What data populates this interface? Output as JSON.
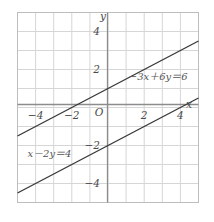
{
  "chart_data": {
    "type": "line",
    "title": "",
    "xlabel": "x",
    "ylabel": "y",
    "xlim": [
      -5,
      5
    ],
    "ylim": [
      -5,
      5
    ],
    "grid": true,
    "grid_step": 1,
    "legend": "none",
    "origin_label": "O",
    "x_ticks": [
      {
        "value": -4,
        "label": "−4"
      },
      {
        "value": -2,
        "label": "−2"
      },
      {
        "value": 2,
        "label": "2"
      },
      {
        "value": 4,
        "label": "4"
      }
    ],
    "y_ticks": [
      {
        "value": 4,
        "label": "4"
      },
      {
        "value": 2,
        "label": "2"
      },
      {
        "value": -2,
        "label": "−2"
      },
      {
        "value": -4,
        "label": "−4"
      }
    ],
    "series": [
      {
        "name": "-3x+6y=6",
        "equation_label": "−3x＋6y＝6",
        "slope": 0.5,
        "intercept": 1,
        "x_intercept": -2,
        "y_intercept": 1,
        "points": [
          [
            -5,
            -1.5
          ],
          [
            5,
            3.5
          ]
        ],
        "color": "#3a3a3a"
      },
      {
        "name": "x-2y=4",
        "equation_label": "x－2y＝4",
        "slope": 0.5,
        "intercept": -2,
        "x_intercept": 4,
        "y_intercept": -2,
        "points": [
          [
            -5,
            -4.5
          ],
          [
            5,
            0.5
          ]
        ],
        "color": "#3a3a3a"
      }
    ],
    "annotations": [
      {
        "text": "−3x＋6y＝6",
        "x": 1.15,
        "y": 1.45,
        "anchor": "start"
      },
      {
        "text": "x－2y＝4",
        "x": -4.45,
        "y": -2.6,
        "anchor": "start"
      }
    ],
    "colors": {
      "grid": "#d6d6d6",
      "axis": "#8c8c8c",
      "border": "#bdbdbd",
      "line": "#3a3a3a",
      "text": "#4a4a4a",
      "background": "#ffffff"
    }
  }
}
